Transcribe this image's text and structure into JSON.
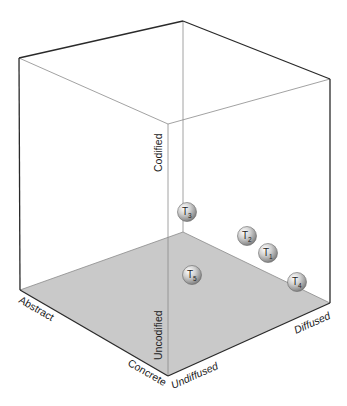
{
  "diagram": {
    "type": "3d-cube-information-space",
    "colors": {
      "floor": "#c9c9c9",
      "edge_dark": "#2a2a2a",
      "edge_light": "#8a8a8a",
      "sphere_highlight": "#ffffff",
      "sphere_mid": "#cfcfcf",
      "sphere_shadow": "#7a7a7a"
    },
    "axes": {
      "codification": {
        "high": "Codified",
        "low": "Uncodified"
      },
      "abstraction": {
        "high": "Abstract",
        "low": "Concrete"
      },
      "diffusion": {
        "low": "Undiffused",
        "high": "Diffused"
      }
    },
    "nodes": [
      {
        "id": "T1",
        "letter": "T",
        "sub": "1"
      },
      {
        "id": "T2",
        "letter": "T",
        "sub": "2"
      },
      {
        "id": "T3",
        "letter": "T",
        "sub": "3"
      },
      {
        "id": "T4",
        "letter": "T",
        "sub": "4"
      },
      {
        "id": "T5",
        "letter": "T",
        "sub": "5"
      }
    ]
  }
}
